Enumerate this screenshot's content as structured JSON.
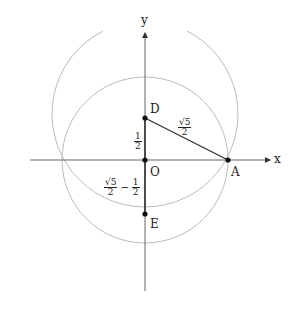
{
  "axes": {
    "x_label": "x",
    "y_label": "y"
  },
  "points": {
    "D": "D",
    "O": "O",
    "A": "A",
    "E": "E"
  },
  "segment_labels": {
    "DO": {
      "num": "1",
      "den": "2"
    },
    "DA": {
      "num": "√5",
      "den": "2"
    },
    "OE": {
      "num1": "√5",
      "den1": "2",
      "op": "−",
      "num2": "1",
      "den2": "2"
    }
  },
  "colors": {
    "axis": "#555555",
    "circle": "#bbbbbb",
    "segment": "#333333",
    "point": "#111111"
  }
}
